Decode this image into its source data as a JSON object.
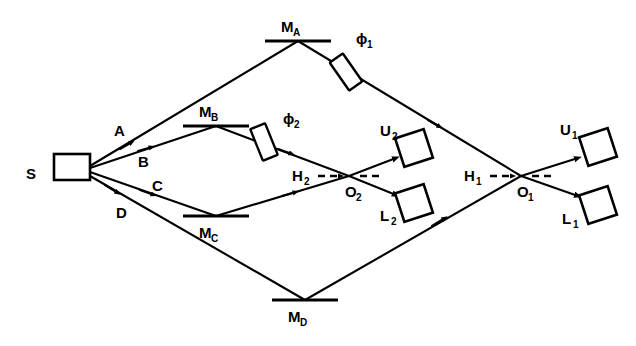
{
  "figure": {
    "type": "optical-interferometer-schematic",
    "background_color": "#ffffff",
    "stroke_color": "#000000",
    "width": 636,
    "height": 346
  },
  "source": {
    "name": "source-box",
    "label": "S",
    "shape": "rectangle",
    "x": 54,
    "y": 154,
    "w": 36,
    "h": 26,
    "label_x": 40,
    "label_y": 173
  },
  "rays": [
    {
      "id": "A",
      "label": "A",
      "label_x": 118,
      "label_y": 131,
      "from": "S",
      "to": "M_A"
    },
    {
      "id": "B",
      "label": "B",
      "label_x": 142,
      "label_y": 162,
      "from": "S",
      "to": "M_B"
    },
    {
      "id": "C",
      "label": "C",
      "label_x": 155,
      "label_y": 186,
      "from": "S",
      "to": "M_C"
    },
    {
      "id": "D",
      "label": "D",
      "label_x": 120,
      "label_y": 213,
      "from": "S",
      "to": "M_D"
    }
  ],
  "mirrors": [
    {
      "id": "M_A",
      "label": "M",
      "sub": "A",
      "x": 265,
      "y": 41,
      "w": 66,
      "label_x": 288,
      "label_y": 30,
      "label_pos": "above"
    },
    {
      "id": "M_B",
      "label": "M",
      "sub": "B",
      "x": 183,
      "y": 126,
      "w": 66,
      "label_x": 207,
      "label_y": 116,
      "label_pos": "above"
    },
    {
      "id": "M_C",
      "label": "M",
      "sub": "C",
      "x": 183,
      "y": 216,
      "w": 66,
      "label_x": 207,
      "label_y": 240,
      "label_pos": "below"
    },
    {
      "id": "M_D",
      "label": "M",
      "sub": "D",
      "x": 272,
      "y": 300,
      "w": 66,
      "label_x": 296,
      "label_y": 324,
      "label_pos": "below"
    }
  ],
  "phase_shifters": [
    {
      "id": "phi_1",
      "label": "ϕ",
      "sub": "1",
      "cx": 346,
      "cy": 72,
      "angle": -36,
      "label_x": 362,
      "label_y": 43
    },
    {
      "id": "phi_2",
      "label": "ϕ",
      "sub": "2",
      "cx": 264,
      "cy": 142,
      "angle": -36,
      "label_x": 288,
      "label_y": 122
    }
  ],
  "crossings": [
    {
      "id": "O_2",
      "label": "O",
      "sub": "2",
      "x": 349,
      "y": 176,
      "label_x": 352,
      "label_y": 196,
      "axis_label": "H",
      "axis_sub": "2",
      "axis_label_x": 296,
      "axis_label_y": 179
    },
    {
      "id": "O_1",
      "label": "O",
      "sub": "1",
      "x": 521,
      "y": 176,
      "label_x": 524,
      "label_y": 196,
      "axis_label": "H",
      "axis_sub": "1",
      "axis_label_x": 468,
      "axis_label_y": 179
    }
  ],
  "detectors": [
    {
      "id": "U_2",
      "label": "U",
      "sub": "2",
      "cx": 414,
      "cy": 148,
      "size": 30,
      "label_x": 386,
      "label_y": 135
    },
    {
      "id": "L_2",
      "label": "L",
      "sub": "2",
      "cx": 414,
      "cy": 203,
      "size": 30,
      "label_x": 386,
      "label_y": 219
    },
    {
      "id": "U_1",
      "label": "U",
      "sub": "1",
      "cx": 598,
      "cy": 147,
      "size": 30,
      "label_x": 566,
      "label_y": 134
    },
    {
      "id": "L_1",
      "label": "L",
      "sub": "1",
      "cx": 598,
      "cy": 205,
      "size": 30,
      "label_x": 568,
      "label_y": 222
    }
  ],
  "dashed_axes": [
    {
      "id": "H_2-axis",
      "x1": 318,
      "y1": 176,
      "x2": 382,
      "y2": 176
    },
    {
      "id": "H_1-axis",
      "x1": 490,
      "y1": 176,
      "x2": 554,
      "y2": 176
    }
  ]
}
